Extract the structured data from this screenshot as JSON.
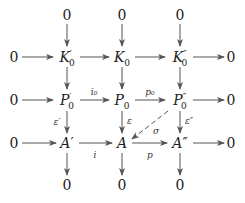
{
  "diagram": {
    "type": "commutative-diagram",
    "nodes": {
      "top": [
        "0",
        "0",
        "0"
      ],
      "row1": {
        "left": "0",
        "a": "K",
        "a_sub": "0",
        "a_prime": "′",
        "b": "K",
        "b_sub": "0",
        "c": "K",
        "c_sub": "0",
        "c_prime": "″",
        "right": "0"
      },
      "row2": {
        "left": "0",
        "a": "P",
        "a_sub": "0",
        "a_prime": "′",
        "b": "P",
        "b_sub": "0",
        "c": "P",
        "c_sub": "0",
        "c_prime": "″",
        "right": "0"
      },
      "row3": {
        "left": "0",
        "a": "A′",
        "b": "A",
        "c": "A″",
        "right": "0"
      },
      "bottom": [
        "0",
        "0",
        "0"
      ]
    },
    "labels": {
      "i0": "i₀",
      "p0": "p₀",
      "eps_prime": "ε′",
      "eps": "ε",
      "eps_dprime": "ε″",
      "sigma": "σ",
      "i": "i",
      "p": "p"
    },
    "colors": {
      "text": "#222222",
      "arrow": "#555555"
    }
  }
}
